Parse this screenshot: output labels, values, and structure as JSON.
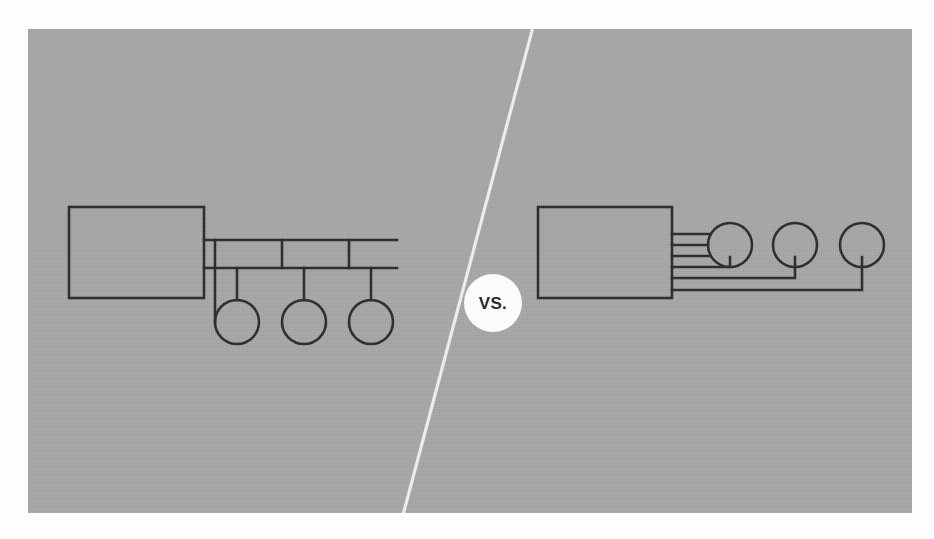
{
  "figure": {
    "divider": {
      "label": "VS.",
      "name": "vs-divider",
      "line_color": "#f2f2f2",
      "top_x": 533,
      "top_y": 27,
      "bottom_x": 403,
      "bottom_y": 513
    },
    "panel": {
      "background_color": "#a8a8a8",
      "ink_color": "#2b2b2b"
    },
    "left_diagram": {
      "name": "bus-topology-diagram",
      "description": "Controller block connected to three devices by two shared horizontal bus lines",
      "block": {
        "x": 69,
        "y": 207,
        "width": 135,
        "height": 91
      },
      "bus_lines": [
        {
          "y": 240,
          "x1": 204,
          "x2": 397
        },
        {
          "y": 268,
          "x1": 204,
          "x2": 397
        }
      ],
      "nodes": [
        {
          "cx": 237,
          "cy": 322,
          "r": 22
        },
        {
          "cx": 304,
          "cy": 322,
          "r": 22
        },
        {
          "cx": 371,
          "cy": 322,
          "r": 22
        }
      ],
      "drop_pairs": [
        {
          "bus_x": 215,
          "node_x": 237
        },
        {
          "bus_x": 282,
          "node_x": 304
        },
        {
          "bus_x": 349,
          "node_x": 371
        }
      ]
    },
    "right_diagram": {
      "name": "point-to-point-topology-diagram",
      "description": "Controller block connected to three devices by six individual dedicated lines",
      "block": {
        "x": 538,
        "y": 207,
        "width": 134,
        "height": 91
      },
      "nodes": [
        {
          "cx": 730,
          "cy": 245,
          "r": 22
        },
        {
          "cx": 795,
          "cy": 245,
          "r": 22
        },
        {
          "cx": 862,
          "cy": 245,
          "r": 22
        }
      ],
      "link_rows": [
        234,
        245,
        256,
        267,
        278,
        290
      ]
    }
  },
  "scan_artifacts": {
    "top_ghost_line": "",
    "bottom_ghost_line": ""
  }
}
